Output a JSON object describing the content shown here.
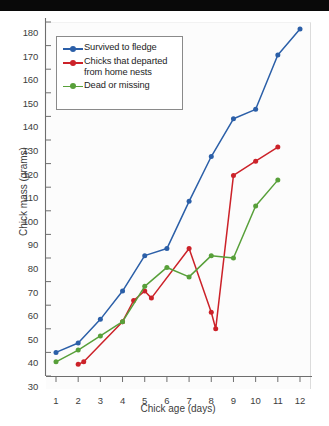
{
  "figure": {
    "background": "#ffffff",
    "scan_bar_color": "#090909"
  },
  "chart_data": {
    "type": "line",
    "title": "",
    "xlabel": "Chick age (days)",
    "ylabel": "Chick mass (grams)",
    "xlim": [
      0.5,
      12.5
    ],
    "ylim": [
      30,
      180
    ],
    "xticks": [
      1,
      2,
      3,
      4,
      5,
      6,
      7,
      8,
      9,
      10,
      11,
      12
    ],
    "yticks": [
      30,
      40,
      50,
      60,
      70,
      80,
      90,
      100,
      110,
      120,
      130,
      140,
      150,
      160,
      170,
      180
    ],
    "grid": false,
    "legend_position": "upper left",
    "series": [
      {
        "name": "Survived to fledge",
        "color": "#2b5fa8",
        "x": [
          1,
          2,
          3,
          4,
          5,
          6,
          7,
          8,
          9,
          10,
          11,
          12
        ],
        "values": [
          40,
          44,
          54,
          66,
          81,
          84,
          104,
          123,
          139,
          143,
          166,
          177
        ]
      },
      {
        "name": "Chicks that departed from home nests",
        "color": "#cc2229",
        "x": [
          2,
          2.25,
          4,
          4.5,
          5,
          5.3,
          7,
          8,
          8.2,
          9,
          10,
          11
        ],
        "values": [
          35,
          36,
          53,
          62,
          66,
          63,
          84,
          57,
          50,
          115,
          121,
          127
        ]
      },
      {
        "name": "Dead or missing",
        "color": "#58a03a",
        "x": [
          1,
          2,
          3,
          4,
          5,
          6,
          7,
          8,
          9,
          10,
          11
        ],
        "values": [
          36,
          41,
          47,
          53,
          68,
          76,
          72,
          81,
          80,
          102,
          113
        ]
      }
    ]
  },
  "legend": {
    "entries": [
      {
        "label": "Survived to fledge",
        "color": "#2b5fa8"
      },
      {
        "label": "Chicks that departed",
        "label2": "from home nests",
        "color": "#cc2229"
      },
      {
        "label": "Dead or missing",
        "color": "#58a03a"
      }
    ]
  }
}
